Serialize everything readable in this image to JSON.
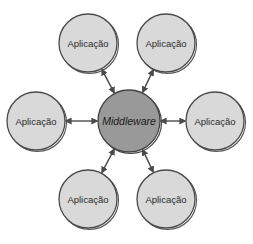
{
  "diagram": {
    "center": {
      "label": "Middleware",
      "x": 129,
      "y": 121,
      "r": 31,
      "fill": "#999999"
    },
    "nodes": [
      {
        "label": "Aplicação",
        "x": 88,
        "y": 43
      },
      {
        "label": "Aplicação",
        "x": 166,
        "y": 43
      },
      {
        "label": "Aplicação",
        "x": 36,
        "y": 121
      },
      {
        "label": "Aplicação",
        "x": 215,
        "y": 121
      },
      {
        "label": "Aplicação",
        "x": 88,
        "y": 199
      },
      {
        "label": "Aplicação",
        "x": 166,
        "y": 199
      }
    ],
    "node_radius": 29,
    "node_fill": "#d9d9d9",
    "stroke": "#4a4a4a",
    "edge": "bidirectional-arrow"
  }
}
